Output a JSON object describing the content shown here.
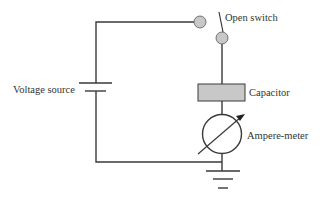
{
  "diagram": {
    "type": "circuit",
    "labels": {
      "switch": "Open switch",
      "voltage_source": "Voltage source",
      "capacitor": "Capacitor",
      "ammeter": "Ampere-meter"
    },
    "colors": {
      "wire": "#3a3a3a",
      "component_fill": "#c8c8c8",
      "background": "#ffffff"
    }
  }
}
